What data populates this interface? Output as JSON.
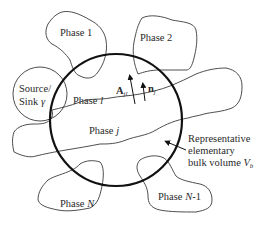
{
  "diagram": {
    "phases": {
      "phase_1": "Phase 1",
      "phase_2": "Phase 2",
      "phase_l_prefix": "Phase ",
      "phase_l_var": "l",
      "phase_j_prefix": "Phase ",
      "phase_j_var": "j",
      "phase_n_prefix": "Phase ",
      "phase_n_var": "N",
      "phase_n1_prefix": "Phase ",
      "phase_n1_var": "N",
      "phase_n1_suffix": "-1"
    },
    "source_sink": {
      "line1": "Source/",
      "line2": "Sink ",
      "symbol": "γ"
    },
    "vectors": {
      "area_vector": "A",
      "area_subscript": "jl",
      "normal_vector": "n",
      "normal_subscript": "j"
    },
    "rev_label": {
      "line1": "Representative",
      "line2": "elementary",
      "line3": "bulk volume ",
      "symbol": "V",
      "subscript": "b"
    },
    "colors": {
      "background": "#ffffff",
      "outline": "#3a3a3a",
      "rev_circle": "#111111",
      "text": "#2a2a2a"
    }
  }
}
